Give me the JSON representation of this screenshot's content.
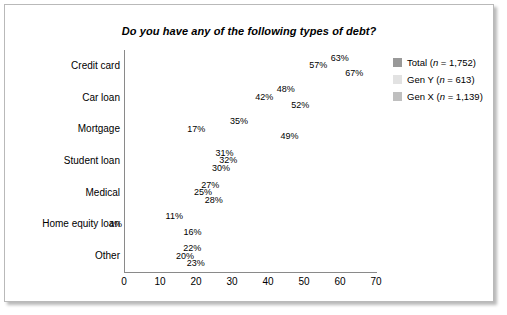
{
  "chart_data": {
    "type": "bar",
    "orientation": "horizontal",
    "title": "Do you have any of the following types of debt?",
    "xlabel": "",
    "ylabel": "",
    "xlim": [
      0,
      70
    ],
    "xticks": [
      0,
      10,
      20,
      30,
      40,
      50,
      60,
      70
    ],
    "grid": false,
    "legend_position": "right",
    "value_suffix": "%",
    "categories": [
      "Credit card",
      "Car loan",
      "Mortgage",
      "Student loan",
      "Medical",
      "Home equity loan",
      "Other"
    ],
    "series": [
      {
        "name": "Total (n = 1,752)",
        "color": "#999999",
        "values": [
          63,
          48,
          35,
          31,
          27,
          11,
          22
        ],
        "labels": [
          "63%",
          "48%",
          "35%",
          "31%",
          "27%",
          "11%",
          "22%"
        ]
      },
      {
        "name": "Gen Y (n = 613)",
        "color": "#e2e2e2",
        "values": [
          57,
          42,
          17,
          32,
          25,
          4,
          20
        ],
        "labels": [
          "57%",
          "42%",
          "17%",
          "32%",
          "25%",
          "4%",
          "20%"
        ]
      },
      {
        "name": "Gen X (n = 1,139)",
        "color": "#bfbfbf",
        "values": [
          67,
          52,
          49,
          30,
          28,
          16,
          23
        ],
        "labels": [
          "67%",
          "52%",
          "49%",
          "30%",
          "28%",
          "16%",
          "23%"
        ]
      }
    ]
  },
  "colors": {
    "total": "#999999",
    "gen_y": "#e2e2e2",
    "gen_x": "#bfbfbf",
    "axis": "#8a8a8a",
    "border": "#b9b9b9",
    "text": "#000000"
  }
}
